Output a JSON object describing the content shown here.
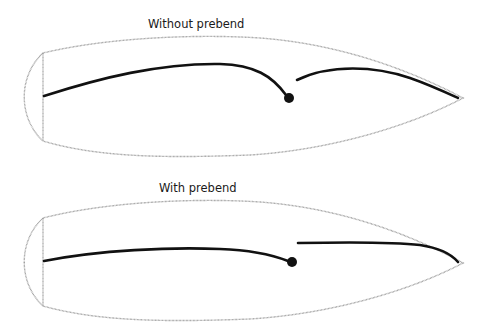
{
  "panels": [
    {
      "id": "without-prebend",
      "title": "Without prebend"
    },
    {
      "id": "with-prebend",
      "title": "With prebend"
    }
  ],
  "colors": {
    "outline": "#9a9a9a",
    "beam": "#111111",
    "background": "#ffffff"
  }
}
